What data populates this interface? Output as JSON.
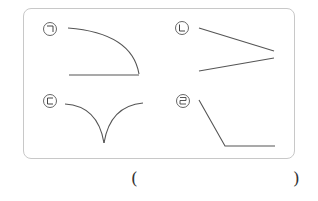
{
  "figures": [
    {
      "label": "㉠",
      "shape": "quarter-arc-with-base-line"
    },
    {
      "label": "㉡",
      "shape": "two-converging-lines"
    },
    {
      "label": "㉢",
      "shape": "two-curves-meeting-at-cusp"
    },
    {
      "label": "㉣",
      "shape": "diagonal-then-horizontal-line"
    }
  ],
  "answer": {
    "open": "(",
    "close": ")",
    "value": ""
  },
  "colors": {
    "stroke": "#555555",
    "frame": "#c8c8c8"
  }
}
